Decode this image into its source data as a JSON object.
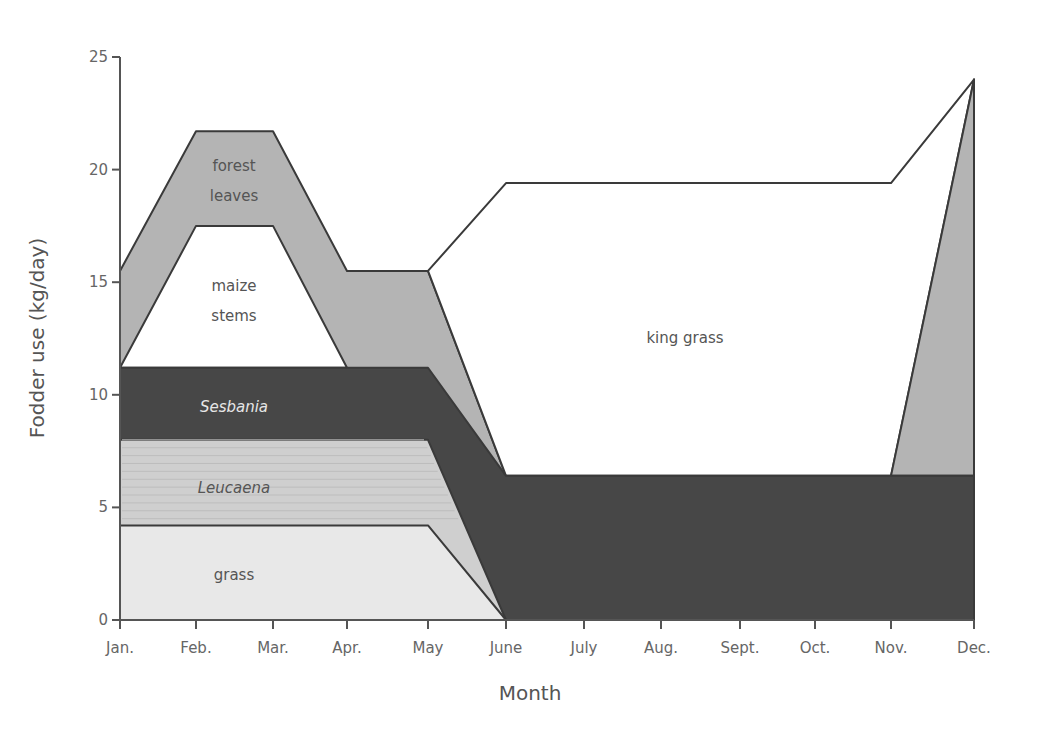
{
  "chart_data": {
    "type": "area",
    "title": "",
    "xlabel": "Month",
    "ylabel": "Fodder use (kg/day)",
    "ylim": [
      0,
      25
    ],
    "yticks": [
      0,
      5,
      10,
      15,
      20,
      25
    ],
    "categories": [
      "Jan.",
      "Feb.",
      "Mar.",
      "Apr.",
      "May",
      "June",
      "July",
      "Aug.",
      "Sept.",
      "Oct.",
      "Nov.",
      "Dec."
    ],
    "stacked": true,
    "grid": false,
    "legend": "inline labels",
    "series": [
      {
        "name": "grass",
        "color": "#e8e8e8",
        "top": [
          4.2,
          4.2,
          4.2,
          4.2,
          4.2,
          0,
          0,
          0,
          0,
          0,
          0,
          0
        ]
      },
      {
        "name": "Leucaena",
        "color": "#cfcfcf",
        "top": [
          8.0,
          8.0,
          8.0,
          8.0,
          8.0,
          0,
          0,
          0,
          0,
          0,
          0,
          0
        ]
      },
      {
        "name": "Sesbania",
        "color": "#474747",
        "top": [
          11.2,
          11.2,
          11.2,
          11.2,
          11.2,
          6.4,
          6.4,
          6.4,
          6.4,
          6.4,
          6.4,
          6.4
        ]
      },
      {
        "name": "maize stems",
        "color": "#ffffff",
        "top": [
          11.2,
          17.5,
          17.5,
          11.2,
          11.2,
          6.4,
          6.4,
          6.4,
          6.4,
          6.4,
          6.4,
          6.4
        ]
      },
      {
        "name": "forest leaves",
        "color": "#b4b4b4",
        "top": [
          15.5,
          21.7,
          21.7,
          15.5,
          15.5,
          6.4,
          6.4,
          6.4,
          6.4,
          6.4,
          6.4,
          24.0
        ]
      },
      {
        "name": "king grass",
        "color": "#ffffff",
        "top": [
          null,
          null,
          null,
          null,
          15.5,
          19.4,
          19.4,
          19.4,
          19.4,
          19.4,
          19.4,
          24.0
        ]
      }
    ],
    "annotations": [
      {
        "text": "forest leaves",
        "x": "Feb.-Mar.",
        "y": 19.5
      },
      {
        "text": "maize stems",
        "x": "Feb.-Mar.",
        "y": 14.5
      },
      {
        "text": "Sesbania",
        "x": "Feb.-Mar.",
        "y": 9.4
      },
      {
        "text": "Leucaena",
        "x": "Feb.-Mar.",
        "y": 5.9
      },
      {
        "text": "grass",
        "x": "Feb.-Mar.",
        "y": 2.0
      },
      {
        "text": "king grass",
        "x": "Aug.-Sept.",
        "y": 12.5
      }
    ]
  },
  "labels": {
    "forest_1": "forest",
    "forest_2": "leaves",
    "maize_1": "maize",
    "maize_2": "stems",
    "sesbania": "Sesbania",
    "leucaena": "Leucaena",
    "grass": "grass",
    "king_grass": "king grass"
  }
}
